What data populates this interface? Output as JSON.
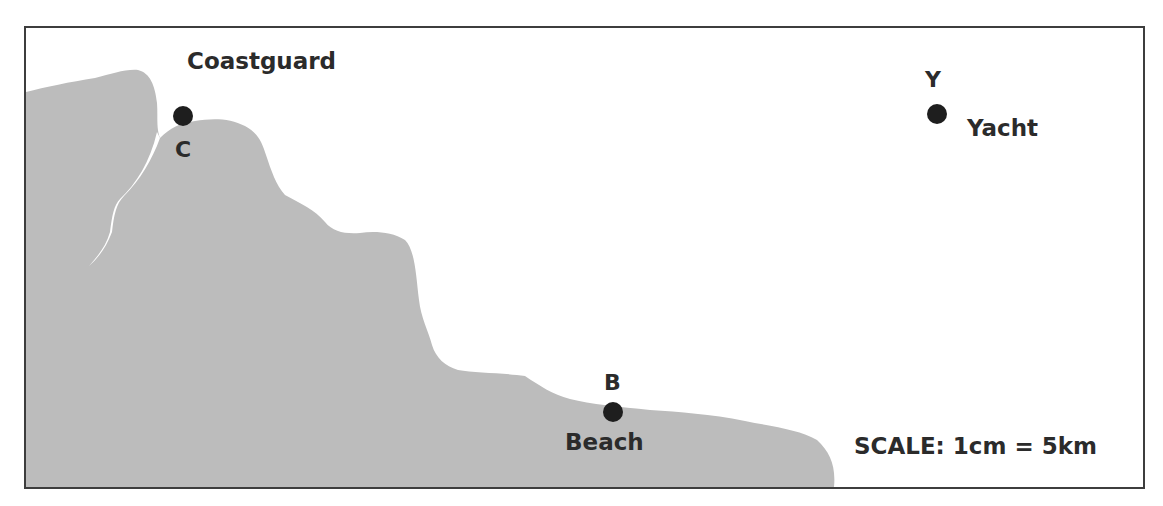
{
  "map": {
    "land_color": "#bcbcbc",
    "border_color": "#3d3d3d",
    "dot_color": "#1e1e1e",
    "text_color": "#2b2b2b",
    "points": [
      {
        "id": "C",
        "letter": "C",
        "name": "Coastguard",
        "x": 183,
        "y": 116
      },
      {
        "id": "Y",
        "letter": "Y",
        "name": "Yacht",
        "x": 937,
        "y": 114
      },
      {
        "id": "B",
        "letter": "B",
        "name": "Beach",
        "x": 613,
        "y": 412
      }
    ],
    "scale": {
      "label": "SCALE: 1cm = 5km"
    }
  }
}
